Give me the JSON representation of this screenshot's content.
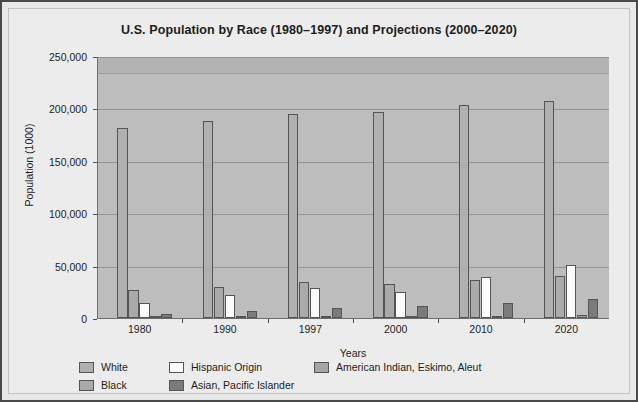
{
  "chart_data": {
    "type": "bar",
    "title": "U.S. Population by Race (1980–1997) and Projections (2000–2020)",
    "xlabel": "Years",
    "ylabel": "Population (1000)",
    "categories": [
      "1980",
      "1990",
      "1997",
      "2000",
      "2010",
      "2020"
    ],
    "ylim": [
      0,
      250000
    ],
    "yticks": [
      "0",
      "50,000",
      "100,000",
      "150,000",
      "200,000",
      "250,000"
    ],
    "ytick_values": [
      0,
      50000,
      100000,
      150000,
      200000,
      250000
    ],
    "grid": true,
    "legend_position": "bottom",
    "series": [
      {
        "name": "White",
        "color": "#b0b0b0",
        "values": [
          181000,
          188000,
          195000,
          197000,
          203000,
          207000
        ]
      },
      {
        "name": "Black",
        "color": "#aaaaaa",
        "values": [
          26500,
          30000,
          34000,
          32000,
          36000,
          40000
        ]
      },
      {
        "name": "Hispanic Origin",
        "color": "#fbfbfb",
        "values": [
          14600,
          22400,
          29000,
          25000,
          39000,
          51000
        ]
      },
      {
        "name": "American Indian, Eskimo, Aleut",
        "color": "#a5a5a5",
        "values": [
          1400,
          1800,
          2000,
          2000,
          2300,
          2600
        ]
      },
      {
        "name": "Asian, Pacific Islander",
        "color": "#7b7b7b",
        "values": [
          3500,
          7000,
          9900,
          11000,
          14400,
          18000
        ]
      }
    ]
  }
}
